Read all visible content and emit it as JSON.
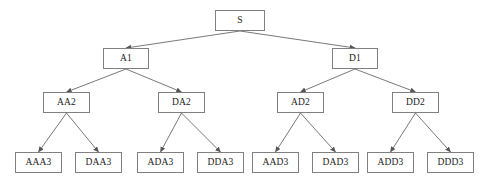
{
  "diagram": {
    "type": "tree",
    "title": "",
    "background_color": "#ffffff",
    "node_border_color": "#808080",
    "node_fill_color": "#ffffff",
    "edge_color": "#555555",
    "text_color": "#1a1a1a",
    "levels": [
      {
        "level": 0,
        "nodes": [
          {
            "id": "S",
            "label": "S",
            "x": 215,
            "y": 10,
            "w": 50,
            "h": 21
          }
        ]
      },
      {
        "level": 1,
        "nodes": [
          {
            "id": "A1",
            "label": "A1",
            "x": 103,
            "y": 48,
            "w": 46,
            "h": 21
          },
          {
            "id": "D1",
            "label": "D1",
            "x": 332,
            "y": 48,
            "w": 46,
            "h": 21
          }
        ]
      },
      {
        "level": 2,
        "nodes": [
          {
            "id": "AA2",
            "label": "AA2",
            "x": 43,
            "y": 92,
            "w": 47,
            "h": 21
          },
          {
            "id": "DA2",
            "label": "DA2",
            "x": 158,
            "y": 92,
            "w": 47,
            "h": 21
          },
          {
            "id": "AD2",
            "label": "AD2",
            "x": 277,
            "y": 92,
            "w": 47,
            "h": 21
          },
          {
            "id": "DD2",
            "label": "DD2",
            "x": 392,
            "y": 92,
            "w": 47,
            "h": 21
          }
        ]
      },
      {
        "level": 3,
        "nodes": [
          {
            "id": "AAA3",
            "label": "AAA3",
            "x": 15,
            "y": 152,
            "w": 47,
            "h": 21
          },
          {
            "id": "DAA3",
            "label": "DAA3",
            "x": 75,
            "y": 152,
            "w": 47,
            "h": 21
          },
          {
            "id": "ADA3",
            "label": "ADA3",
            "x": 137,
            "y": 152,
            "w": 47,
            "h": 21
          },
          {
            "id": "DDA3",
            "label": "DDA3",
            "x": 197,
            "y": 152,
            "w": 47,
            "h": 21
          },
          {
            "id": "AAD3",
            "label": "AAD3",
            "x": 252,
            "y": 152,
            "w": 47,
            "h": 21
          },
          {
            "id": "DAD3",
            "label": "DAD3",
            "x": 312,
            "y": 152,
            "w": 47,
            "h": 21
          },
          {
            "id": "ADD3",
            "label": "ADD3",
            "x": 367,
            "y": 152,
            "w": 47,
            "h": 21
          },
          {
            "id": "DDD3",
            "label": "DDD3",
            "x": 427,
            "y": 152,
            "w": 47,
            "h": 21
          }
        ]
      }
    ],
    "edges": [
      {
        "from": "S",
        "to": "A1"
      },
      {
        "from": "S",
        "to": "D1"
      },
      {
        "from": "A1",
        "to": "AA2"
      },
      {
        "from": "A1",
        "to": "DA2"
      },
      {
        "from": "D1",
        "to": "AD2"
      },
      {
        "from": "D1",
        "to": "DD2"
      },
      {
        "from": "AA2",
        "to": "AAA3"
      },
      {
        "from": "AA2",
        "to": "DAA3"
      },
      {
        "from": "DA2",
        "to": "ADA3"
      },
      {
        "from": "DA2",
        "to": "DDA3"
      },
      {
        "from": "AD2",
        "to": "AAD3"
      },
      {
        "from": "AD2",
        "to": "DAD3"
      },
      {
        "from": "DD2",
        "to": "ADD3"
      },
      {
        "from": "DD2",
        "to": "DDD3"
      }
    ]
  }
}
